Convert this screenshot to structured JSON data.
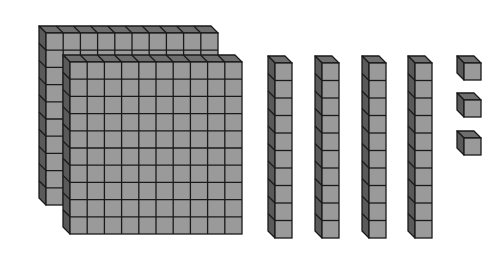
{
  "represented_number": 243,
  "colors": {
    "face": "#9a9a9a",
    "top": "#6e6e6e",
    "side": "#5a5a5a",
    "line": "#1a1a1a",
    "background": "#ffffff"
  },
  "blocks": {
    "hundreds": {
      "count": 2,
      "label": "hundreds flats",
      "items": [
        {
          "x": 46,
          "y": 33,
          "size": 172,
          "depth": 7
        },
        {
          "x": 70,
          "y": 62,
          "size": 172,
          "depth": 7
        }
      ]
    },
    "tens": {
      "count": 4,
      "label": "tens rods",
      "items": [
        {
          "x": 275,
          "y": 63,
          "w": 17,
          "h": 175,
          "depth": 7
        },
        {
          "x": 322,
          "y": 63,
          "w": 17,
          "h": 175,
          "depth": 7
        },
        {
          "x": 369,
          "y": 63,
          "w": 17,
          "h": 175,
          "depth": 7
        },
        {
          "x": 415,
          "y": 63,
          "w": 17,
          "h": 175,
          "depth": 7
        }
      ]
    },
    "ones": {
      "count": 3,
      "label": "unit cubes",
      "items": [
        {
          "x": 464,
          "y": 63,
          "size": 17,
          "depth": 7
        },
        {
          "x": 464,
          "y": 100,
          "size": 17,
          "depth": 7
        },
        {
          "x": 464,
          "y": 138,
          "size": 17,
          "depth": 7
        }
      ]
    }
  }
}
